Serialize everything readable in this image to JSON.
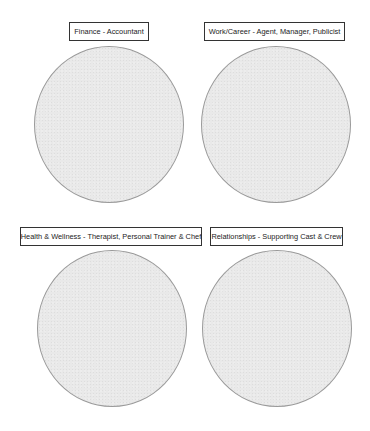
{
  "diagram": {
    "quadrants": [
      {
        "id": "finance",
        "label": "Finance - Accountant"
      },
      {
        "id": "work-career",
        "label": "Work/Career - Agent, Manager, Publicist"
      },
      {
        "id": "health-wellness",
        "label": "Health & Wellness - Therapist, Personal Trainer & Chef"
      },
      {
        "id": "relationships",
        "label": "Relationships - Supporting Cast & Crew"
      }
    ],
    "colors": {
      "circle_fill": "#e9e9e9",
      "circle_outline": "#9a9a9a",
      "label_border": "#333333",
      "label_text": "#222222",
      "background": "#ffffff"
    }
  }
}
